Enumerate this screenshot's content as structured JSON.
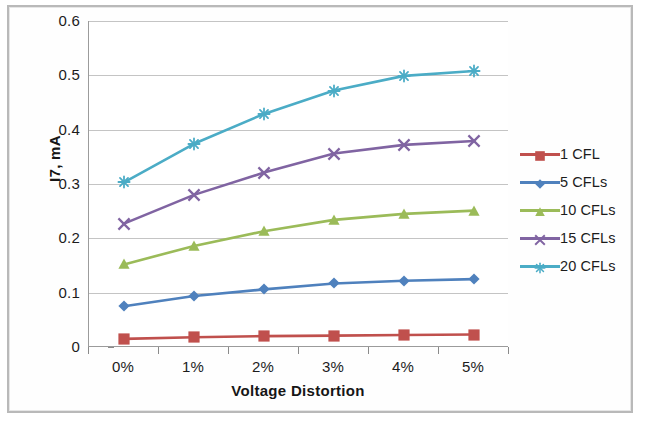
{
  "chart_data": {
    "type": "line",
    "title": "",
    "xlabel": "Voltage Distortion",
    "ylabel": "I7, mA",
    "categories": [
      "0%",
      "1%",
      "2%",
      "3%",
      "4%",
      "5%"
    ],
    "ylim": [
      0,
      0.6
    ],
    "yticks": [
      "0",
      "0.1",
      "0.2",
      "0.3",
      "0.4",
      "0.5",
      "0.6"
    ],
    "ytick_values": [
      0,
      0.1,
      0.2,
      0.3,
      0.4,
      0.5,
      0.6
    ],
    "grid": "horizontal",
    "legend_position": "right",
    "series": [
      {
        "name": "1 CFL",
        "color": "#c0504d",
        "marker": "square",
        "values": [
          0.015,
          0.018,
          0.02,
          0.021,
          0.022,
          0.023
        ]
      },
      {
        "name": "5 CFLs",
        "color": "#4f81bd",
        "marker": "diamond",
        "values": [
          0.075,
          0.094,
          0.106,
          0.117,
          0.122,
          0.125
        ]
      },
      {
        "name": "10 CFLs",
        "color": "#9bbb59",
        "marker": "triangle",
        "values": [
          0.152,
          0.186,
          0.213,
          0.234,
          0.245,
          0.251
        ]
      },
      {
        "name": "15 CFLs",
        "color": "#8064a2",
        "marker": "x",
        "values": [
          0.227,
          0.28,
          0.321,
          0.356,
          0.372,
          0.379
        ]
      },
      {
        "name": "20 CFLs",
        "color": "#4bacc6",
        "marker": "asterisk",
        "values": [
          0.303,
          0.374,
          0.429,
          0.472,
          0.499,
          0.508
        ]
      }
    ]
  }
}
